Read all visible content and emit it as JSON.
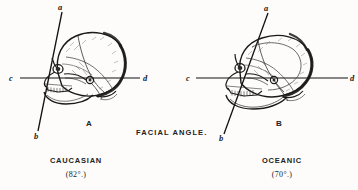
{
  "plate": {
    "title": "FACIAL ANGLE.",
    "background_color": "#fdfcfa",
    "ink_color": "#1a1a1a"
  },
  "figures": [
    {
      "letter": "A",
      "caption": "CAUCASIAN",
      "angle_caption": "(82°.)",
      "angle_degrees": 82,
      "labels": {
        "facial_line_top": "a",
        "facial_line_bottom": "b",
        "horizontal_left": "c",
        "horizontal_right": "d"
      }
    },
    {
      "letter": "B",
      "caption": "OCEANIC",
      "angle_caption": "(70°.)",
      "angle_degrees": 70,
      "labels": {
        "facial_line_top": "a",
        "facial_line_bottom": "b",
        "horizontal_left": "c",
        "horizontal_right": "d"
      }
    }
  ]
}
